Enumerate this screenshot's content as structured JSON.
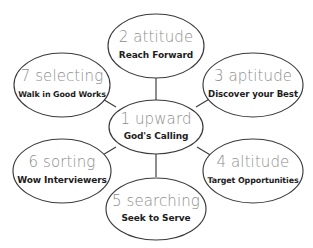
{
  "diagram": {
    "type": "hub-and-spoke",
    "background_color": "#ffffff",
    "outline_color": "#3a3a3a",
    "title_color": "#8d8d8d",
    "subtitle_color": "#1d1d1d",
    "center": {
      "id": "node-1-upward",
      "title": "1 upward",
      "subtitle": "God's Calling"
    },
    "nodes": [
      {
        "id": "node-2-attitude",
        "title": "2 attitude",
        "subtitle": "Reach Forward",
        "position": "top"
      },
      {
        "id": "node-3-aptitude",
        "title": "3 aptitude",
        "subtitle": "Discover your Best",
        "position": "upper-right"
      },
      {
        "id": "node-4-altitude",
        "title": "4 altitude",
        "subtitle": "Target Opportunities",
        "position": "lower-right"
      },
      {
        "id": "node-5-searching",
        "title": "5 searching",
        "subtitle": "Seek to Serve",
        "position": "bottom"
      },
      {
        "id": "node-6-sorting",
        "title": "6 sorting",
        "subtitle": "Wow Interviewers",
        "position": "lower-left"
      },
      {
        "id": "node-7-selecting",
        "title": "7 selecting",
        "subtitle": "Walk in Good Works",
        "position": "upper-left"
      }
    ]
  }
}
